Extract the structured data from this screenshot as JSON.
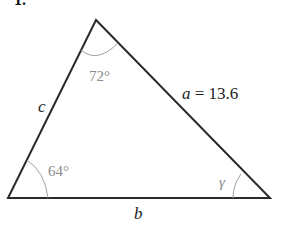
{
  "problem_number": "1.",
  "triangle": {
    "vertices": {
      "top": [
        96,
        20
      ],
      "bottom_left": [
        8,
        198
      ],
      "bottom_right": [
        270,
        198
      ]
    },
    "angles": {
      "top": "72°",
      "bottom_left": "64°",
      "bottom_right": "γ"
    },
    "sides": {
      "left": "c",
      "right_var": "a",
      "right_value": " = 13.6",
      "bottom": "b"
    }
  },
  "colors": {
    "line": "#2a2a2a",
    "angle_arc": "#a0a0a0",
    "angle_text": "#8a8a8a"
  }
}
